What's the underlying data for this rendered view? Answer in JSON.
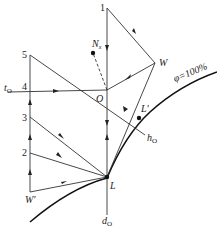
{
  "diagram": {
    "points": {
      "p1": "1",
      "p2": "2",
      "p3": "3",
      "p4": "4",
      "p5": "5",
      "O": "O",
      "W": "W",
      "W_prime": "W'",
      "L": "L",
      "L_prime": "L'",
      "N": "N",
      "N_sub": "x"
    },
    "lines": {
      "t": "t",
      "t_sub": "O",
      "h": "h",
      "h_sub": "O",
      "d": "d",
      "d_sub": "O"
    },
    "curve_label": "φ=100%"
  }
}
